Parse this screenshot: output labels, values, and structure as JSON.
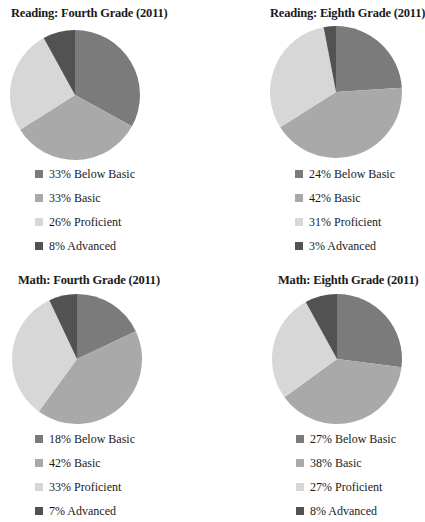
{
  "colors": {
    "below_basic": "#7b7b7b",
    "basic": "#a9a9a9",
    "proficient": "#d7d7d7",
    "advanced": "#525252"
  },
  "chart_data": [
    {
      "type": "pie",
      "title": "Reading: Fourth Grade (2011)",
      "categories": [
        "Below Basic",
        "Basic",
        "Proficient",
        "Advanced"
      ],
      "values": [
        33,
        33,
        26,
        8
      ],
      "legend": [
        {
          "label": "33% Below Basic"
        },
        {
          "label": "33% Basic"
        },
        {
          "label": "26% Proficient"
        },
        {
          "label": "8% Advanced"
        }
      ],
      "legend_position": "bottom"
    },
    {
      "type": "pie",
      "title": "Reading: Eighth Grade (2011)",
      "categories": [
        "Below Basic",
        "Basic",
        "Proficient",
        "Advanced"
      ],
      "values": [
        24,
        42,
        31,
        3
      ],
      "legend": [
        {
          "label": "24% Below Basic"
        },
        {
          "label": "42% Basic"
        },
        {
          "label": "31% Proficient"
        },
        {
          "label": "3% Advanced"
        }
      ],
      "legend_position": "bottom"
    },
    {
      "type": "pie",
      "title": "Math: Fourth Grade (2011)",
      "categories": [
        "Below Basic",
        "Basic",
        "Proficient",
        "Advanced"
      ],
      "values": [
        18,
        42,
        33,
        7
      ],
      "legend": [
        {
          "label": "18% Below Basic"
        },
        {
          "label": "42% Basic"
        },
        {
          "label": "33% Proficient"
        },
        {
          "label": "7% Advanced"
        }
      ],
      "legend_position": "bottom"
    },
    {
      "type": "pie",
      "title": "Math: Eighth Grade (2011)",
      "categories": [
        "Below Basic",
        "Basic",
        "Proficient",
        "Advanced"
      ],
      "values": [
        27,
        38,
        27,
        8
      ],
      "legend": [
        {
          "label": "27% Below Basic"
        },
        {
          "label": "38% Basic"
        },
        {
          "label": "27% Proficient"
        },
        {
          "label": "8% Advanced"
        }
      ],
      "legend_position": "bottom"
    }
  ]
}
